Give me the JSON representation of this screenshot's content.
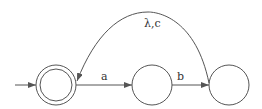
{
  "diagram": {
    "type": "finite-automaton",
    "stroke_color": "#555555",
    "states": [
      {
        "id": "q0",
        "label": "",
        "start": true,
        "accepting": true
      },
      {
        "id": "q1",
        "label": "",
        "start": false,
        "accepting": false
      },
      {
        "id": "q2",
        "label": "",
        "start": false,
        "accepting": false
      }
    ],
    "transitions": [
      {
        "from": "q0",
        "to": "q1",
        "label": "a"
      },
      {
        "from": "q1",
        "to": "q2",
        "label": "b"
      },
      {
        "from": "q2",
        "to": "q0",
        "label": "λ,c"
      }
    ]
  }
}
